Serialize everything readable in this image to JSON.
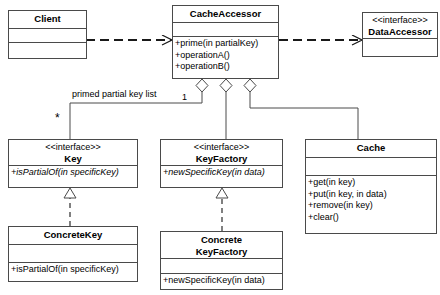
{
  "diagram": {
    "type": "uml-class-diagram",
    "canvas": {
      "width": 440,
      "height": 295
    },
    "line_color": "#4a4a4a",
    "background": "#ffffff"
  },
  "classes": {
    "client": {
      "name": "Client",
      "stereotype": "",
      "attributes": [],
      "operations": []
    },
    "cache_accessor": {
      "name": "CacheAccessor",
      "stereotype": "",
      "attributes": [],
      "operations": [
        "+prime(in partialKey)",
        "+operationA()",
        "+operationB()"
      ]
    },
    "data_accessor": {
      "name": "DataAccessor",
      "stereotype": "<<interface>>",
      "attributes": [],
      "operations": []
    },
    "key": {
      "name": "Key",
      "stereotype": "<<interface>>",
      "attributes": [],
      "operations": [
        "+isPartialOf(in specificKey)"
      ]
    },
    "concrete_key": {
      "name": "ConcreteKey",
      "stereotype": "",
      "attributes": [],
      "operations": [
        "+isPartialOf(in specificKey)"
      ]
    },
    "key_factory": {
      "name": "KeyFactory",
      "stereotype": "<<interface>>",
      "attributes": [],
      "operations": [
        "+newSpecificKey(in data)"
      ]
    },
    "concrete_key_factory": {
      "name_line1": "Concrete",
      "name_line2": "KeyFactory",
      "stereotype": "",
      "attributes": [],
      "operations": [
        "+newSpecificKey(in data)"
      ]
    },
    "cache": {
      "name": "Cache",
      "stereotype": "",
      "attributes": [],
      "operations": [
        "+get(in key)",
        "+put(in key, in data)",
        "+remove(in key)",
        "+clear()"
      ]
    }
  },
  "relationships": {
    "client_to_cache_accessor": {
      "type": "dependency",
      "style": "dashed-open-arrow",
      "label": ""
    },
    "cache_accessor_to_data_accessor": {
      "type": "dependency",
      "style": "dashed-open-arrow",
      "label": ""
    },
    "cache_accessor_to_key": {
      "type": "aggregation",
      "style": "hollow-diamond",
      "label": "primed partial key list",
      "source_multiplicity": "1",
      "target_multiplicity": "*"
    },
    "cache_accessor_to_key_factory": {
      "type": "aggregation",
      "style": "hollow-diamond",
      "label": ""
    },
    "cache_accessor_to_cache": {
      "type": "aggregation",
      "style": "hollow-diamond",
      "label": ""
    },
    "concrete_key_realizes_key": {
      "type": "realization",
      "style": "dashed-hollow-triangle",
      "label": ""
    },
    "concrete_key_factory_realizes_key_factory": {
      "type": "realization",
      "style": "dashed-hollow-triangle",
      "label": ""
    }
  }
}
